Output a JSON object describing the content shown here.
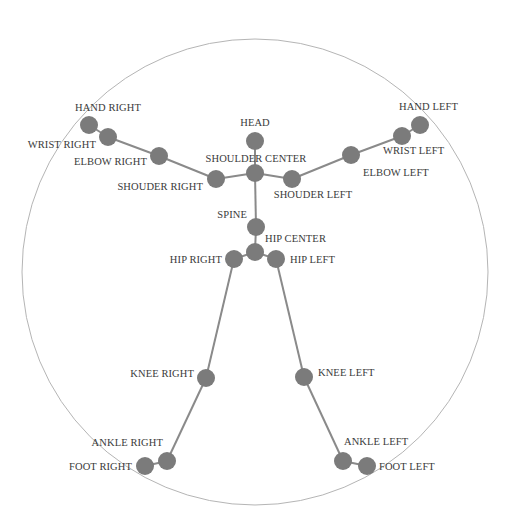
{
  "diagram": {
    "colors": {
      "background": "#ffffff",
      "boundary": "#b5b5b5",
      "bone": "#8a8a8a",
      "joint": "#7b7b7b",
      "label": "#3a3a3a"
    },
    "boundary_circle": {
      "cx": 255,
      "cy": 272,
      "r": 233
    },
    "joint_radius": 9,
    "joints": [
      {
        "id": "head",
        "label": "HEAD",
        "x": 255,
        "y": 141,
        "lx": 255,
        "ly": 126,
        "anchor": "middle"
      },
      {
        "id": "shoulder_center",
        "label": "SHOULDER CENTER",
        "x": 255,
        "y": 173,
        "lx": 256,
        "ly": 162,
        "anchor": "middle"
      },
      {
        "id": "shoulder_right",
        "label": "SHOUDER RIGHT",
        "x": 216,
        "y": 179,
        "lx": 203,
        "ly": 190,
        "anchor": "end"
      },
      {
        "id": "elbow_right",
        "label": "ELBOW RIGHT",
        "x": 159,
        "y": 156,
        "lx": 147,
        "ly": 165,
        "anchor": "end"
      },
      {
        "id": "wrist_right",
        "label": "WRIST RIGHT",
        "x": 108,
        "y": 137,
        "lx": 96,
        "ly": 148,
        "anchor": "end"
      },
      {
        "id": "hand_right",
        "label": "HAND RIGHT",
        "x": 89,
        "y": 125,
        "lx": 108,
        "ly": 111,
        "anchor": "middle"
      },
      {
        "id": "shoulder_left",
        "label": "SHOUDER LEFT",
        "x": 292,
        "y": 179,
        "lx": 313,
        "ly": 198,
        "anchor": "middle"
      },
      {
        "id": "elbow_left",
        "label": "ELBOW LEFT",
        "x": 351,
        "y": 155,
        "lx": 363,
        "ly": 176,
        "anchor": "start"
      },
      {
        "id": "wrist_left",
        "label": "WRIST LEFT",
        "x": 402,
        "y": 136,
        "lx": 383,
        "ly": 154,
        "anchor": "start"
      },
      {
        "id": "hand_left",
        "label": "HAND LEFT",
        "x": 420,
        "y": 125,
        "lx": 399,
        "ly": 110,
        "anchor": "start"
      },
      {
        "id": "spine",
        "label": "SPINE",
        "x": 256,
        "y": 227,
        "lx": 247,
        "ly": 218,
        "anchor": "end"
      },
      {
        "id": "hip_center",
        "label": "HIP CENTER",
        "x": 255,
        "y": 252,
        "lx": 265,
        "ly": 242,
        "anchor": "start"
      },
      {
        "id": "hip_right",
        "label": "HIP RIGHT",
        "x": 234,
        "y": 259,
        "lx": 222,
        "ly": 263,
        "anchor": "end"
      },
      {
        "id": "hip_left",
        "label": "HIP LEFT",
        "x": 276,
        "y": 259,
        "lx": 290,
        "ly": 263,
        "anchor": "start"
      },
      {
        "id": "knee_right",
        "label": "KNEE RIGHT",
        "x": 206,
        "y": 378,
        "lx": 194,
        "ly": 377,
        "anchor": "end"
      },
      {
        "id": "knee_left",
        "label": "KNEE LEFT",
        "x": 304,
        "y": 377,
        "lx": 318,
        "ly": 376,
        "anchor": "start"
      },
      {
        "id": "ankle_right",
        "label": "ANKLE RIGHT",
        "x": 167,
        "y": 461,
        "lx": 163,
        "ly": 446,
        "anchor": "end"
      },
      {
        "id": "foot_right",
        "label": "FOOT RIGHT",
        "x": 145,
        "y": 466,
        "lx": 132,
        "ly": 470,
        "anchor": "end"
      },
      {
        "id": "ankle_left",
        "label": "ANKLE LEFT",
        "x": 343,
        "y": 461,
        "lx": 344,
        "ly": 445,
        "anchor": "start"
      },
      {
        "id": "foot_left",
        "label": "FOOT LEFT",
        "x": 367,
        "y": 466,
        "lx": 379,
        "ly": 470,
        "anchor": "start"
      }
    ],
    "bones": [
      [
        "head",
        "shoulder_center"
      ],
      [
        "shoulder_center",
        "shoulder_right"
      ],
      [
        "shoulder_right",
        "elbow_right"
      ],
      [
        "elbow_right",
        "wrist_right"
      ],
      [
        "wrist_right",
        "hand_right"
      ],
      [
        "shoulder_center",
        "shoulder_left"
      ],
      [
        "shoulder_left",
        "elbow_left"
      ],
      [
        "elbow_left",
        "wrist_left"
      ],
      [
        "wrist_left",
        "hand_left"
      ],
      [
        "shoulder_center",
        "spine"
      ],
      [
        "spine",
        "hip_center"
      ],
      [
        "hip_center",
        "hip_right"
      ],
      [
        "hip_center",
        "hip_left"
      ],
      [
        "hip_right",
        "knee_right"
      ],
      [
        "knee_right",
        "ankle_right"
      ],
      [
        "ankle_right",
        "foot_right"
      ],
      [
        "hip_left",
        "knee_left"
      ],
      [
        "knee_left",
        "ankle_left"
      ],
      [
        "ankle_left",
        "foot_left"
      ]
    ]
  }
}
